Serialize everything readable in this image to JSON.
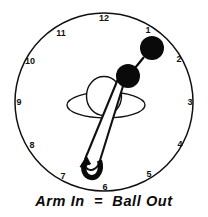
{
  "diagram": {
    "title_caption": "Arm In  =  Ball Out",
    "colors": {
      "stroke": "#111111",
      "fill_ball": "#0a0a0a",
      "background": "#ffffff"
    },
    "clock_face": {
      "center_x": 104,
      "center_y": 102,
      "radius": 89,
      "hour_labels": [
        {
          "label": "12",
          "hour": 12,
          "x": 104,
          "y": 21
        },
        {
          "label": "1",
          "hour": 1,
          "x": 148,
          "y": 33
        },
        {
          "label": "2",
          "hour": 2,
          "x": 179,
          "y": 62
        },
        {
          "label": "3",
          "hour": 3,
          "x": 190,
          "y": 105
        },
        {
          "label": "4",
          "hour": 4,
          "x": 180,
          "y": 147
        },
        {
          "label": "5",
          "hour": 5,
          "x": 149,
          "y": 177
        },
        {
          "label": "6",
          "hour": 6,
          "x": 105,
          "y": 189
        },
        {
          "label": "7",
          "hour": 7,
          "x": 63,
          "y": 179
        },
        {
          "label": "8",
          "hour": 8,
          "x": 32,
          "y": 148
        },
        {
          "label": "9",
          "hour": 9,
          "x": 19,
          "y": 105
        },
        {
          "label": "10",
          "hour": 10,
          "x": 30,
          "y": 64
        },
        {
          "label": "11",
          "hour": 11,
          "x": 61,
          "y": 36
        }
      ]
    },
    "body": {
      "shoulders_ellipse": {
        "cx": 106,
        "cy": 105,
        "rx": 39,
        "ry": 13
      },
      "head_circle": {
        "cx": 104,
        "cy": 97,
        "rx": 17,
        "ry": 19
      }
    },
    "arm": {
      "description": "long narrow loop from shoulder down to 6-7 o'clock",
      "top_x": 124,
      "top_y": 80,
      "bottom_x": 95,
      "bottom_y": 172
    },
    "balls": [
      {
        "name": "ball-upper",
        "cx": 152,
        "cy": 48,
        "r": 11.5
      },
      {
        "name": "ball-lower",
        "cx": 128,
        "cy": 76,
        "r": 11.5
      }
    ],
    "ball_connector": {
      "x1": 143,
      "y1": 57,
      "x2": 137,
      "y2": 67
    },
    "arrow": {
      "name": "rotation-arrow",
      "label": "curved hook arrow pointing up-left at 6 o'clock"
    }
  }
}
